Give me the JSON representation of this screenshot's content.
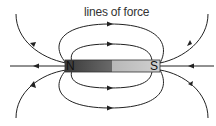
{
  "diagram": {
    "title": "lines of force",
    "magnet": {
      "north_label": "N",
      "south_label": "S",
      "north_color": "#555555",
      "south_color": "#bbbbbb"
    },
    "line_color": "#222222"
  }
}
